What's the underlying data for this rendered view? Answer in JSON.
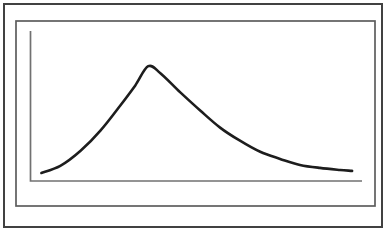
{
  "figure": {
    "background": "#ffffff",
    "outer_frame_color": "#414141",
    "inner_frame_color": "#5d5d5d",
    "axis_color": "#717171",
    "curve_color": "#1d1d1d"
  },
  "chart_data": {
    "type": "line",
    "title": "",
    "subtitle": "",
    "xlabel": "",
    "ylabel": "",
    "tick_labels": "none",
    "grid": false,
    "legend": false,
    "series_name": "right-skewed-distribution-curve",
    "xlim": [
      0,
      1
    ],
    "ylim": [
      0,
      1.307
    ],
    "x": [
      0.033,
      0.09,
      0.151,
      0.211,
      0.271,
      0.316,
      0.355,
      0.392,
      0.452,
      0.512,
      0.572,
      0.632,
      0.693,
      0.753,
      0.813,
      0.873,
      0.934,
      0.97
    ],
    "y": [
      0.07,
      0.132,
      0.263,
      0.439,
      0.658,
      0.833,
      1.0,
      0.939,
      0.772,
      0.614,
      0.465,
      0.351,
      0.254,
      0.193,
      0.14,
      0.114,
      0.096,
      0.088
    ]
  }
}
